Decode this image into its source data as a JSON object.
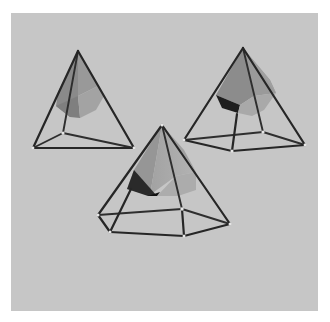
{
  "scene": {
    "description": "Three wireframe pyramids, each containing a shaded solid polyhedron, rendered on a light gray background",
    "background_color": "#c6c6c6",
    "frame_color": "#ffffff",
    "rod_color": "#262626",
    "objects": [
      {
        "name": "left-pyramid",
        "type": "triangular wireframe pyramid with inner polyhedron"
      },
      {
        "name": "right-pyramid",
        "type": "square wireframe pyramid with inner polyhedron"
      },
      {
        "name": "center-pyramid",
        "type": "pentagonal wireframe pyramid with inner polyhedron"
      }
    ]
  }
}
